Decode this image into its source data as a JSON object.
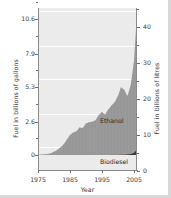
{
  "chart_data": {
    "type": "area",
    "stacked": true,
    "title": "",
    "xlabel": "Year",
    "ylabel": "Fuel in billions of gallons",
    "ylabel_secondary": "Fuel in billions of litres",
    "xlim": [
      1975,
      2006
    ],
    "ylim": [
      0,
      11.9
    ],
    "ylim_secondary": [
      0,
      45
    ],
    "grid": true,
    "legend_position": "inline-annotation",
    "xticks": [
      1975,
      1985,
      1995,
      2005
    ],
    "xticklabels": [
      "1975",
      "1985",
      "1995",
      "2005"
    ],
    "yticks": [
      0,
      2.6,
      5.3,
      7.9,
      10.6
    ],
    "yticklabels": [
      "0",
      "2.6",
      "5.3",
      "7.9",
      "10.6"
    ],
    "yticks_secondary": [
      0,
      10,
      20,
      30,
      40
    ],
    "yticklabels_secondary": [
      "0",
      "10",
      "20",
      "30",
      "40"
    ],
    "yminorticks": [
      1.3,
      3.95,
      6.6,
      9.25,
      11.9
    ],
    "yminorticks_secondary": [
      5,
      15,
      25,
      35,
      45
    ],
    "x": [
      1975,
      1976,
      1977,
      1978,
      1979,
      1980,
      1981,
      1982,
      1983,
      1984,
      1985,
      1986,
      1987,
      1988,
      1989,
      1990,
      1991,
      1992,
      1993,
      1994,
      1995,
      1996,
      1997,
      1998,
      1999,
      2000,
      2001,
      2002,
      2003,
      2004,
      2005,
      2006
    ],
    "series": [
      {
        "name": "Ethanol",
        "color": "#9a9a9a",
        "values": [
          0.02,
          0.03,
          0.05,
          0.08,
          0.14,
          0.25,
          0.38,
          0.58,
          0.82,
          1.18,
          1.55,
          1.75,
          1.85,
          2.15,
          2.1,
          2.45,
          2.55,
          2.6,
          2.7,
          3.1,
          3.35,
          3.15,
          3.55,
          3.85,
          4.1,
          4.55,
          5.25,
          5.05,
          4.55,
          5.35,
          7.0,
          10.6
        ]
      },
      {
        "name": "Biodiesel",
        "color": "#3b3b3b",
        "values": [
          0,
          0,
          0,
          0,
          0,
          0,
          0,
          0,
          0,
          0,
          0,
          0,
          0,
          0,
          0,
          0,
          0,
          0,
          0,
          0,
          0,
          0,
          0,
          0.01,
          0.02,
          0.02,
          0.03,
          0.04,
          0.05,
          0.07,
          0.18,
          0.42
        ]
      }
    ],
    "annotations": [
      {
        "text": "Ethanol",
        "x": 1999,
        "y": 3.2
      },
      {
        "text": "Biodiesel",
        "x": 1999,
        "y": 0.5
      }
    ]
  },
  "axes": {
    "left": {
      "title": "Fuel in billions of gallons",
      "ticks": [
        {
          "label": "10.6",
          "pos": 11.0
        },
        {
          "label": "7.9",
          "pos": 45.5
        },
        {
          "label": "5.3",
          "pos": 79.0
        },
        {
          "label": "2.6",
          "pos": 113.5
        },
        {
          "label": "0",
          "pos": 147.0
        }
      ]
    },
    "right": {
      "title": "Fuel in billions of litres",
      "ticks": [
        {
          "label": "40",
          "pos": 18.5
        },
        {
          "label": "30",
          "pos": 54.5
        },
        {
          "label": "20",
          "pos": 90.5
        },
        {
          "label": "10",
          "pos": 126.5
        },
        {
          "label": "0",
          "pos": 162.5
        }
      ]
    },
    "bottom": {
      "title": "Year",
      "ticks": [
        {
          "label": "1975",
          "pos": 38.0
        },
        {
          "label": "1985",
          "pos": 70.0
        },
        {
          "label": "1995",
          "pos": 102.0
        },
        {
          "label": "2005",
          "pos": 134.0
        }
      ]
    }
  },
  "labels": {
    "ethanol": "Ethanol",
    "biodiesel": "Biodiesel"
  }
}
